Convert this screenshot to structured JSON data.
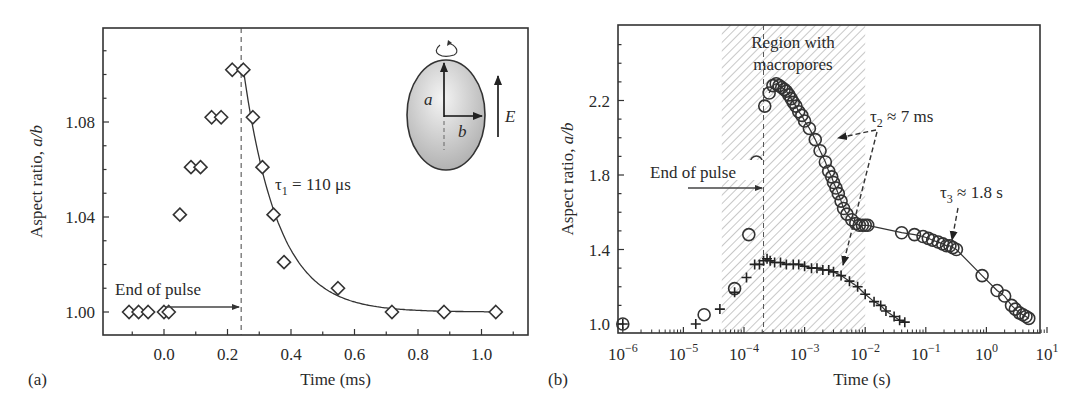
{
  "chart_data": [
    {
      "panel_label": "(a)",
      "type": "scatter",
      "title": "",
      "xlabel": "Time (ms)",
      "ylabel": "Aspect ratio, a/b",
      "xlim": [
        -0.19,
        1.15
      ],
      "ylim": [
        0.99,
        1.12
      ],
      "xticks": [
        0.0,
        0.2,
        0.4,
        0.6,
        0.8,
        1.0
      ],
      "xtick_labels": [
        "0.0",
        "0.2",
        "0.4",
        "0.6",
        "0.8",
        "1.0"
      ],
      "yticks": [
        1.0,
        1.04,
        1.08
      ],
      "ytick_labels": [
        "1.00",
        "1.04",
        "1.08"
      ],
      "grid": false,
      "series": [
        {
          "name": "measured",
          "marker": "diamond",
          "x": [
            -0.11,
            -0.08,
            -0.05,
            0.0,
            0.015,
            0.05,
            0.085,
            0.115,
            0.15,
            0.18,
            0.215,
            0.25,
            0.28,
            0.31,
            0.345,
            0.378,
            0.548,
            0.718,
            0.882,
            1.045
          ],
          "y": [
            1.0,
            1.0,
            1.0,
            1.0,
            1.0,
            1.041,
            1.061,
            1.061,
            1.082,
            1.082,
            1.102,
            1.102,
            1.082,
            1.061,
            1.041,
            1.021,
            1.01,
            1.0,
            1.0,
            1.0
          ]
        },
        {
          "name": "exponential fit",
          "marker": "line",
          "fit": {
            "model": "exp_decay",
            "t0": 0.25,
            "y0": 1.102,
            "y_inf": 1.0,
            "tau_ms": 0.11,
            "x_end": 1.045
          }
        }
      ],
      "annotations": [
        {
          "text": "End of pulse",
          "type": "arrow",
          "x": 0.243
        },
        {
          "text_main": "τ",
          "text_sub": "1",
          "text_rest": " = 110 μs"
        },
        {
          "type": "vline-dashed",
          "x": 0.243
        }
      ],
      "inset": {
        "axis_a": "a",
        "axis_b": "b",
        "field": "E",
        "description": "ellipsoidal vesicle rotating around a-axis with electric field E"
      }
    },
    {
      "panel_label": "(b)",
      "type": "scatter",
      "title": "",
      "xlabel": "Time (s)",
      "ylabel": "Aspect ratio, a/b",
      "xscale": "log",
      "xlim": [
        1e-06,
        10
      ],
      "ylim": [
        0.95,
        2.5
      ],
      "xticks_exp": [
        -6,
        -5,
        -4,
        -3,
        -2,
        -1,
        0,
        1
      ],
      "yticks": [
        1.0,
        1.4,
        1.8,
        2.2
      ],
      "ytick_labels": [
        "1.0",
        "1.4",
        "1.8",
        "2.2"
      ],
      "grid": false,
      "shaded_region": {
        "label_line1": "Region with",
        "label_line2": "macropores",
        "x_from": 4.3e-05,
        "x_to": 0.01,
        "pattern": "hatched"
      },
      "series": [
        {
          "name": "circles",
          "marker": "circle",
          "x": [
            1e-06,
            2.2e-05,
            7e-05,
            0.00012,
            0.00016,
            0.00022,
            0.00026,
            0.0003,
            0.00034,
            0.00038,
            0.00042,
            0.00046,
            0.0005,
            0.00055,
            0.0006,
            0.00065,
            0.00072,
            0.0008,
            0.0009,
            0.001,
            0.0012,
            0.0015,
            0.0018,
            0.0022,
            0.0025,
            0.0028,
            0.003,
            0.0033,
            0.0036,
            0.004,
            0.0044,
            0.005,
            0.006,
            0.007,
            0.008,
            0.009,
            0.01,
            0.011,
            0.04,
            0.065,
            0.09,
            0.11,
            0.13,
            0.16,
            0.19,
            0.22,
            0.25,
            0.28,
            0.32,
            0.85,
            1.5,
            2.0,
            2.6,
            3.0,
            3.5,
            4.0,
            4.5,
            5.0
          ],
          "y": [
            1.0,
            1.05,
            1.19,
            1.48,
            1.87,
            2.17,
            2.24,
            2.28,
            2.29,
            2.28,
            2.27,
            2.26,
            2.25,
            2.23,
            2.21,
            2.19,
            2.17,
            2.14,
            2.12,
            2.09,
            2.05,
            1.99,
            1.93,
            1.87,
            1.82,
            1.79,
            1.76,
            1.73,
            1.7,
            1.66,
            1.62,
            1.59,
            1.56,
            1.54,
            1.53,
            1.53,
            1.53,
            1.53,
            1.49,
            1.48,
            1.47,
            1.46,
            1.45,
            1.44,
            1.43,
            1.42,
            1.42,
            1.41,
            1.4,
            1.26,
            1.18,
            1.15,
            1.1,
            1.08,
            1.06,
            1.05,
            1.04,
            1.03
          ]
        },
        {
          "name": "crosses",
          "marker": "plus",
          "x": [
            1e-06,
            1.6e-05,
            4e-05,
            7e-05,
            0.00011,
            0.00015,
            0.00018,
            0.00021,
            0.00024,
            0.00027,
            0.00032,
            0.0004,
            0.0005,
            0.00065,
            0.0008,
            0.001,
            0.0013,
            0.0016,
            0.002,
            0.0025,
            0.003,
            0.004,
            0.0055,
            0.0075,
            0.01,
            0.014,
            0.018,
            0.022,
            0.03,
            0.037,
            0.045
          ],
          "y": [
            1.0,
            1.0,
            1.08,
            1.17,
            1.25,
            1.32,
            1.32,
            1.34,
            1.35,
            1.34,
            1.33,
            1.33,
            1.32,
            1.32,
            1.32,
            1.31,
            1.3,
            1.3,
            1.29,
            1.29,
            1.28,
            1.26,
            1.23,
            1.2,
            1.16,
            1.12,
            1.1,
            1.07,
            1.04,
            1.02,
            1.01
          ]
        }
      ],
      "annotations": [
        {
          "text": "End of pulse",
          "type": "arrow",
          "x": 0.00021
        },
        {
          "text_main": "τ",
          "text_sub": "2",
          "text_rest": " ≈ 7 ms"
        },
        {
          "text_main": "τ",
          "text_sub": "3",
          "text_rest": " ≈ 1.8 s"
        },
        {
          "type": "vline-dashed",
          "x": 0.00021
        }
      ]
    }
  ]
}
